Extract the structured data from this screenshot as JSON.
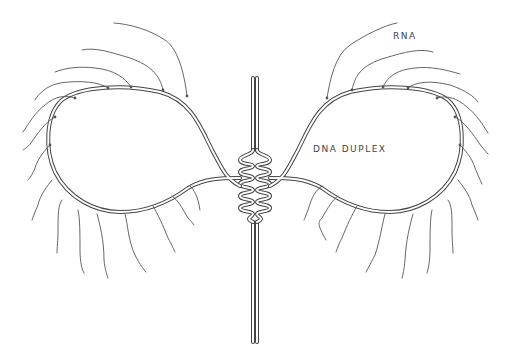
{
  "diagram": {
    "type": "molecular-biology-schematic",
    "labels": {
      "rna": "RNA",
      "dna": "DNA DUPLEX"
    },
    "colors": {
      "background": "#ffffff",
      "strand": "#444444",
      "rna": "#555555"
    },
    "loops": [
      {
        "side": "left",
        "rna_transcripts_count": 16
      },
      {
        "side": "right",
        "rna_transcripts_count": 16
      }
    ]
  }
}
